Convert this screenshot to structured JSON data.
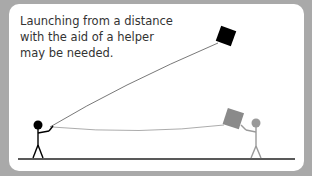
{
  "caption": {
    "lines": [
      "Launching from a distance",
      "with the aid of a helper",
      "may be needed."
    ]
  },
  "colors": {
    "background": "#a9a9a9",
    "card": "#ffffff",
    "flyer": "#000000",
    "kite_flying": "#000000",
    "helper": "#9a9a9a",
    "kite_held": "#8a8a8a",
    "string": "#555555",
    "ground": "#222222"
  }
}
